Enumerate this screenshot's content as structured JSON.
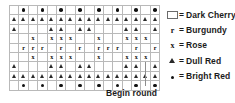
{
  "chart_data": {
    "type": "table",
    "columns": 16,
    "rows": 9,
    "symbol_key": {
      "blank": "Dark Cherry",
      "r": "Burgundy",
      "x": "Rose",
      "tri": "Dull Red",
      "dot": "Bright Red"
    },
    "grid": [
      [
        "blank",
        "dot",
        "blank",
        "dot",
        "blank",
        "dot",
        "blank",
        "dot",
        "blank",
        "dot",
        "blank",
        "dot",
        "blank",
        "dot",
        "blank",
        "dot"
      ],
      [
        "tri",
        "tri",
        "tri",
        "tri",
        "tri",
        "tri",
        "tri",
        "tri",
        "tri",
        "tri",
        "tri",
        "tri",
        "tri",
        "tri",
        "tri",
        "tri"
      ],
      [
        "tri",
        "blank",
        "blank",
        "blank",
        "tri",
        "tri",
        "blank",
        "tri",
        "tri",
        "blank",
        "blank",
        "blank",
        "tri",
        "tri",
        "blank",
        "tri"
      ],
      [
        "blank",
        "blank",
        "x",
        "blank",
        "x",
        "x",
        "x",
        "blank",
        "blank",
        "x",
        "blank",
        "blank",
        "x",
        "x",
        "x",
        "blank"
      ],
      [
        "blank",
        "r",
        "r",
        "r",
        "blank",
        "r",
        "blank",
        "r",
        "blank",
        "r",
        "r",
        "r",
        "blank",
        "r",
        "blank",
        "r"
      ],
      [
        "blank",
        "blank",
        "x",
        "blank",
        "x",
        "x",
        "x",
        "blank",
        "blank",
        "x",
        "blank",
        "blank",
        "x",
        "x",
        "x",
        "blank"
      ],
      [
        "tri",
        "blank",
        "blank",
        "blank",
        "tri",
        "tri",
        "blank",
        "tri",
        "tri",
        "blank",
        "blank",
        "blank",
        "tri",
        "tri",
        "blank",
        "tri"
      ],
      [
        "tri",
        "tri",
        "tri",
        "tri",
        "tri",
        "tri",
        "tri",
        "tri",
        "tri",
        "tri",
        "tri",
        "tri",
        "tri",
        "tri",
        "tri",
        "tri"
      ],
      [
        "blank",
        "dot",
        "blank",
        "dot",
        "blank",
        "dot",
        "blank",
        "dot",
        "blank",
        "dot",
        "blank",
        "dot",
        "blank",
        "dot",
        "blank",
        "dot"
      ]
    ]
  },
  "legend": {
    "items": [
      {
        "symbol": "blank",
        "glyph": "",
        "equals": "=",
        "label": "Dark Cherry"
      },
      {
        "symbol": "r",
        "glyph": "r",
        "equals": "=",
        "label": "Burgundy"
      },
      {
        "symbol": "x",
        "glyph": "x",
        "equals": "=",
        "label": "Rose"
      },
      {
        "symbol": "tri",
        "glyph": "",
        "equals": "=",
        "label": "Dull Red"
      },
      {
        "symbol": "dot",
        "glyph": "",
        "equals": "=",
        "label": "Bright Red"
      }
    ]
  },
  "annotation": {
    "begin_round_label": "Begin round"
  },
  "colors": {
    "ink": "#1b1b1b",
    "grid_line": "#b9b9b9",
    "symbol": "#111111",
    "tick": "#8d8d8d",
    "background": "#ffffff"
  }
}
